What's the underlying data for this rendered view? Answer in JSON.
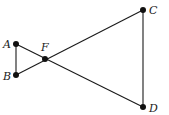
{
  "diagram": {
    "type": "geometry",
    "points": [
      {
        "id": "A",
        "label": "A",
        "x": 16,
        "y": 44,
        "lx": 3,
        "ly": 48
      },
      {
        "id": "B",
        "label": "B",
        "x": 16,
        "y": 75,
        "lx": 3,
        "ly": 80
      },
      {
        "id": "F",
        "label": "F",
        "x": 45,
        "y": 59,
        "lx": 41,
        "ly": 51
      },
      {
        "id": "C",
        "label": "C",
        "x": 143,
        "y": 10,
        "lx": 149,
        "ly": 14
      },
      {
        "id": "D",
        "label": "D",
        "x": 143,
        "y": 107,
        "lx": 149,
        "ly": 112
      }
    ],
    "segments": [
      [
        "A",
        "B"
      ],
      [
        "A",
        "D"
      ],
      [
        "B",
        "C"
      ],
      [
        "C",
        "D"
      ]
    ],
    "colors": {
      "stroke": "#1a1a1a",
      "point": "#111111"
    }
  }
}
